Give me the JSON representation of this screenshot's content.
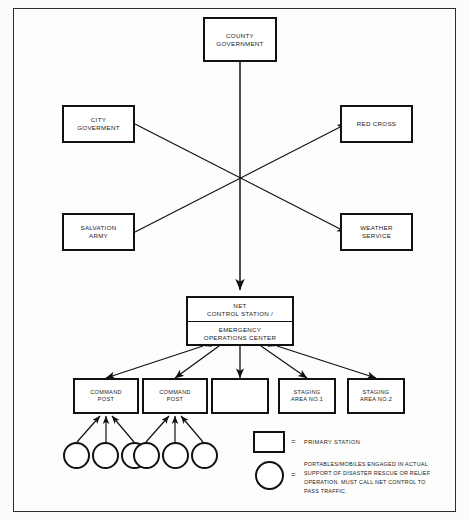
{
  "diagram": {
    "nodes": {
      "county_government": {
        "line1": "COUNTY",
        "line2": "GOVERNMENT"
      },
      "city_government": {
        "line1": "CITY",
        "line2": "GOVERMENT"
      },
      "red_cross": {
        "line1": "RED CROSS",
        "line2": ""
      },
      "salvation_army": {
        "line1": "SALVATION",
        "line2": "ARMY"
      },
      "weather_service": {
        "line1": "WEATHER",
        "line2": "SERVICE"
      },
      "net_control": {
        "line1": "NET",
        "line2": "CONTROL STATION /",
        "line3": "EMERGENCY",
        "line4": "OPERATIONS CENTER"
      },
      "command_post_1": {
        "line1": "COMMAND",
        "line2": "POST"
      },
      "command_post_2": {
        "line1": "COMMAND",
        "line2": "POST"
      },
      "unlabeled_station": {
        "line1": "",
        "line2": ""
      },
      "staging_area_1": {
        "line1": "STAGING",
        "line2": "AREA NO.1"
      },
      "staging_area_2": {
        "line1": "STAGING",
        "line2": "AREA NO.2"
      }
    },
    "legend": {
      "equals_1": "=",
      "equals_2": "=",
      "primary_station_label": "PRIMARY STATION",
      "portable_label_line1": "PORTABLES/MOBILES ENGAGED IN ACTUAL",
      "portable_label_line2": "SUPPORT OF DISASTER  RESCUE OR RELIEF",
      "portable_label_line3": "OPERATION.  MUST CALL NET CONTROL TO",
      "portable_label_line4": "PASS TRAFFIC."
    },
    "colors": {
      "line": "#111111",
      "border": "#2b2b2b",
      "background": "#fdfdfc",
      "text": "#1a1a1a"
    }
  }
}
